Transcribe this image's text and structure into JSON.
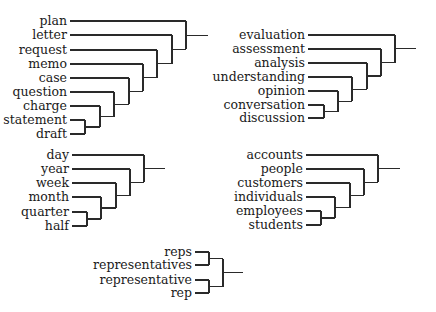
{
  "diagram": {
    "type": "dendrogram",
    "line_color": "#2a2a2a",
    "text_color": "#1a1a1a",
    "clusters": [
      {
        "id": "documents",
        "label_right_x": 67,
        "line_start_x": 70,
        "leaves": [
          {
            "label": "plan",
            "y": 21
          },
          {
            "label": "letter",
            "y": 35
          },
          {
            "label": "request",
            "y": 50
          },
          {
            "label": "memo",
            "y": 64
          },
          {
            "label": "case",
            "y": 78
          },
          {
            "label": "question",
            "y": 92
          },
          {
            "label": "charge",
            "y": 106
          },
          {
            "label": "statement",
            "y": 120
          },
          {
            "label": "draft",
            "y": 134
          }
        ],
        "merges": [
          {
            "a": "statement",
            "b": "draft",
            "x": 85
          },
          {
            "a": "charge",
            "b": "m0",
            "x": 100
          },
          {
            "a": "question",
            "b": "m1",
            "x": 114
          },
          {
            "a": "case",
            "b": "m2",
            "x": 129
          },
          {
            "a": "memo",
            "b": "m3",
            "x": 143
          },
          {
            "a": "request",
            "b": "m4",
            "x": 157
          },
          {
            "a": "letter",
            "b": "m5",
            "x": 172
          },
          {
            "a": "plan",
            "b": "m6",
            "x": 186
          }
        ],
        "root_stub_x": 208
      },
      {
        "id": "analysis",
        "label_right_x": 305,
        "line_start_x": 308,
        "leaves": [
          {
            "label": "evaluation",
            "y": 35
          },
          {
            "label": "assessment",
            "y": 49
          },
          {
            "label": "analysis",
            "y": 63
          },
          {
            "label": "understanding",
            "y": 77
          },
          {
            "label": "opinion",
            "y": 91
          },
          {
            "label": "conversation",
            "y": 105
          },
          {
            "label": "discussion",
            "y": 118
          }
        ],
        "merges": [
          {
            "a": "conversation",
            "b": "discussion",
            "x": 324
          },
          {
            "a": "opinion",
            "b": "m0",
            "x": 338
          },
          {
            "a": "understanding",
            "b": "m1",
            "x": 352
          },
          {
            "a": "analysis",
            "b": "m2",
            "x": 367
          },
          {
            "a": "assessment",
            "b": "m3",
            "x": 381
          },
          {
            "a": "evaluation",
            "b": "m4",
            "x": 395
          }
        ],
        "root_stub_x": 416
      },
      {
        "id": "time",
        "label_right_x": 69,
        "line_start_x": 72,
        "leaves": [
          {
            "label": "day",
            "y": 155
          },
          {
            "label": "year",
            "y": 169
          },
          {
            "label": "week",
            "y": 183
          },
          {
            "label": "month",
            "y": 197
          },
          {
            "label": "quarter",
            "y": 212
          },
          {
            "label": "half",
            "y": 226
          }
        ],
        "merges": [
          {
            "a": "quarter",
            "b": "half",
            "x": 87
          },
          {
            "a": "month",
            "b": "m0",
            "x": 101
          },
          {
            "a": "week",
            "b": "m1",
            "x": 116
          },
          {
            "a": "year",
            "b": "m2",
            "x": 130
          },
          {
            "a": "day",
            "b": "m3",
            "x": 144
          }
        ],
        "root_stub_x": 165
      },
      {
        "id": "people",
        "label_right_x": 303,
        "line_start_x": 306,
        "leaves": [
          {
            "label": "accounts",
            "y": 155
          },
          {
            "label": "people",
            "y": 169
          },
          {
            "label": "customers",
            "y": 183
          },
          {
            "label": "individuals",
            "y": 197
          },
          {
            "label": "employees",
            "y": 211
          },
          {
            "label": "students",
            "y": 225
          }
        ],
        "merges": [
          {
            "a": "employees",
            "b": "students",
            "x": 321
          },
          {
            "a": "individuals",
            "b": "m0",
            "x": 335
          },
          {
            "a": "customers",
            "b": "m1",
            "x": 350
          },
          {
            "a": "people",
            "b": "m2",
            "x": 364
          },
          {
            "a": "accounts",
            "b": "m3",
            "x": 378
          }
        ],
        "root_stub_x": 400
      },
      {
        "id": "reps",
        "label_right_x": 192,
        "line_start_x": 195,
        "leaves": [
          {
            "label": "reps",
            "y": 252
          },
          {
            "label": "representatives",
            "y": 265
          },
          {
            "label": "representative",
            "y": 280
          },
          {
            "label": "rep",
            "y": 293
          }
        ],
        "merges": [
          {
            "a": "reps",
            "b": "representatives",
            "x": 209
          },
          {
            "a": "representative",
            "b": "rep",
            "x": 209
          },
          {
            "a": "m0",
            "b": "m1",
            "x": 223
          }
        ],
        "root_stub_x": 243
      }
    ]
  }
}
